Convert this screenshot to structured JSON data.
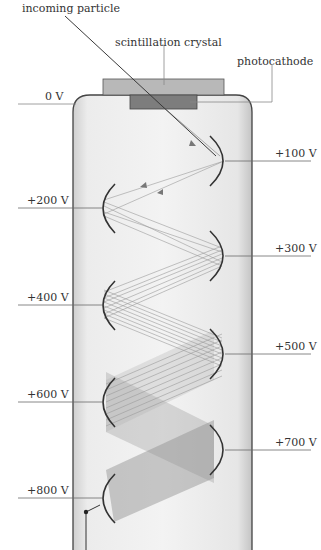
{
  "diagram": {
    "labels": {
      "incoming_particle": "incoming particle",
      "scintillation_crystal": "scintillation crystal",
      "photocathode": "photocathode",
      "cathode_voltage": "0 V"
    },
    "dynodes": [
      {
        "voltage": "+100 V",
        "side": "right"
      },
      {
        "voltage": "+200 V",
        "side": "left"
      },
      {
        "voltage": "+300 V",
        "side": "right"
      },
      {
        "voltage": "+400 V",
        "side": "left"
      },
      {
        "voltage": "+500 V",
        "side": "right"
      },
      {
        "voltage": "+600 V",
        "side": "left"
      },
      {
        "voltage": "+700 V",
        "side": "right"
      },
      {
        "voltage": "+800 V",
        "side": "left"
      }
    ],
    "colors": {
      "tube_fill": "#e9e9e9",
      "tube_stroke": "#444444",
      "crystal": "#b5b5b5",
      "photocathode": "#7a7a7a",
      "dynode": "#333333",
      "electron_path": "#9a9a9a",
      "leader_line": "#6a6a6a"
    }
  }
}
